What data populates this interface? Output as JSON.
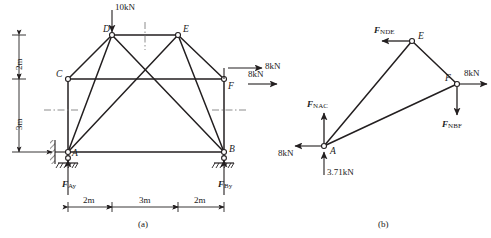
{
  "figure": {
    "background": "#ffffff",
    "line_color": "#231f20",
    "text_color": "#1a1a1a",
    "captions": [
      {
        "id": "caption-a",
        "text": "(a)"
      },
      {
        "id": "caption-b",
        "text": "(b)"
      }
    ]
  },
  "panel_a": {
    "title": "(a)",
    "description": "Truss structure with pin support at A, roller support at B, 10kN downward load at D, 8kN horizontal load at F",
    "nodes": [
      {
        "name": "A",
        "label": "A",
        "x": 68,
        "y": 152
      },
      {
        "name": "B",
        "label": "B",
        "x": 224,
        "y": 152
      },
      {
        "name": "C",
        "label": "C",
        "x": 68,
        "y": 79
      },
      {
        "name": "D",
        "label": "D",
        "x": 112,
        "y": 35
      },
      {
        "name": "E",
        "label": "E",
        "x": 178,
        "y": 35
      },
      {
        "name": "F",
        "label": "F",
        "x": 224,
        "y": 79
      }
    ],
    "members": [
      {
        "from": "D",
        "to": "E"
      },
      {
        "from": "C",
        "to": "D"
      },
      {
        "from": "E",
        "to": "F"
      },
      {
        "from": "A",
        "to": "C"
      },
      {
        "from": "C",
        "to": "F"
      },
      {
        "from": "B",
        "to": "F"
      },
      {
        "from": "A",
        "to": "D"
      },
      {
        "from": "A",
        "to": "E"
      },
      {
        "from": "A",
        "to": "B"
      },
      {
        "from": "B",
        "to": "D"
      },
      {
        "from": "B",
        "to": "E"
      }
    ],
    "loads": [
      {
        "id": "load-10kN",
        "label": "10kN",
        "at_node": "D",
        "direction": "down",
        "magnitude": 10,
        "unit": "kN"
      },
      {
        "id": "load-8kN",
        "label": "8kN",
        "at_node": "F",
        "direction": "right",
        "magnitude": 8,
        "unit": "kN"
      }
    ],
    "reactions": [
      {
        "id": "reaction-Ay",
        "symbol": "F",
        "subscript": "Ay",
        "at_node": "A",
        "direction": "up"
      },
      {
        "id": "reaction-By",
        "symbol": "F",
        "subscript": "By",
        "at_node": "B",
        "direction": "up"
      }
    ],
    "supports": [
      {
        "id": "support-A",
        "at_node": "A",
        "type": "pin"
      },
      {
        "id": "support-B",
        "at_node": "B",
        "type": "roller"
      }
    ],
    "dimensions_horizontal": [
      {
        "id": "dim-2m-left",
        "label": "2m"
      },
      {
        "id": "dim-3m-mid",
        "label": "3m"
      },
      {
        "id": "dim-2m-right",
        "label": "2m"
      }
    ],
    "dimensions_vertical": [
      {
        "id": "dim-2m-vert",
        "label": "2m"
      },
      {
        "id": "dim-3m-vert",
        "label": "3m"
      }
    ]
  },
  "panel_b": {
    "title": "(b)",
    "description": "Free body diagram of section A-E-F showing member forces",
    "nodes": [
      {
        "name": "A",
        "label": "A",
        "x": 324,
        "y": 146
      },
      {
        "name": "E",
        "label": "E",
        "x": 412,
        "y": 41
      },
      {
        "name": "F",
        "label": "F",
        "x": 457,
        "y": 84
      }
    ],
    "members": [
      {
        "from": "A",
        "to": "E"
      },
      {
        "from": "E",
        "to": "F"
      },
      {
        "from": "A",
        "to": "F"
      }
    ],
    "forces": [
      {
        "id": "force-NDE",
        "symbol": "F",
        "subscript": "NDE",
        "label": "F",
        "at_node": "E",
        "direction": "left"
      },
      {
        "id": "force-NAC",
        "symbol": "F",
        "subscript": "NAC",
        "label": "F",
        "at_node": "A",
        "direction": "up"
      },
      {
        "id": "force-NBF",
        "symbol": "F",
        "subscript": "NBF",
        "label": "F",
        "at_node": "F",
        "direction": "down"
      }
    ],
    "loads": [
      {
        "id": "load-8kN-left",
        "label": "8kN",
        "direction": "right",
        "magnitude": 8,
        "unit": "kN"
      },
      {
        "id": "load-8kN-A",
        "label": "8kN",
        "at_node": "A",
        "direction": "left",
        "magnitude": 8,
        "unit": "kN"
      },
      {
        "id": "load-3p71kN",
        "label": "3.71kN",
        "at_node": "A",
        "direction": "up",
        "magnitude": 3.71,
        "unit": "kN"
      },
      {
        "id": "load-8kN-right",
        "label": "8kN",
        "at_node": "F",
        "direction": "right",
        "magnitude": 8,
        "unit": "kN"
      }
    ]
  }
}
